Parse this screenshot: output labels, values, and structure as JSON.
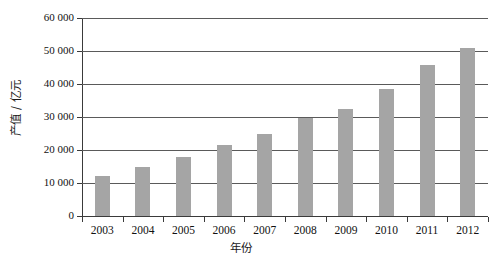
{
  "chart_data": {
    "type": "bar",
    "title": "",
    "xlabel": "年份",
    "ylabel": "产值 / 亿元",
    "categories": [
      "2003",
      "2004",
      "2005",
      "2006",
      "2007",
      "2008",
      "2009",
      "2010",
      "2011",
      "2012"
    ],
    "values": [
      12000,
      14800,
      17800,
      21600,
      25000,
      29800,
      32400,
      38600,
      45800,
      50800
    ],
    "series": [
      {
        "name": "产值",
        "values": [
          12000,
          14800,
          17800,
          21600,
          25000,
          29800,
          32400,
          38600,
          45800,
          50800
        ]
      }
    ],
    "ylim": [
      0,
      60000
    ],
    "ytick_values": [
      0,
      10000,
      20000,
      30000,
      40000,
      50000,
      60000
    ],
    "ytick_labels": [
      "0",
      "10 000",
      "20 000",
      "30 000",
      "40 000",
      "50 000",
      "60 000"
    ],
    "grid": true,
    "grid_axis": "y",
    "legend": false,
    "legend_position": "none",
    "bar_color": "#a5a5a5",
    "axis_color": "#3a3a3a",
    "gridline_color": "#5a5a5a",
    "background_color": "#ffffff"
  }
}
